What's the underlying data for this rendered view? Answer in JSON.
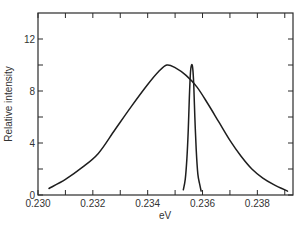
{
  "chart_data": {
    "type": "line",
    "title": "",
    "xlabel": "eV",
    "ylabel": "Relative intensity",
    "xlim": [
      0.23,
      0.2393
    ],
    "ylim": [
      0,
      14
    ],
    "grid": false,
    "legend": null,
    "x_ticks_major": [
      0.23,
      0.232,
      0.234,
      0.236,
      0.238
    ],
    "x_tick_labels": [
      "0.230",
      "0.232",
      "0.234",
      "0.236",
      "0.238"
    ],
    "x_ticks_minor": [
      0.231,
      0.233,
      0.235,
      0.237,
      0.239
    ],
    "y_ticks_major": [
      0,
      4,
      8,
      12
    ],
    "y_tick_labels": [
      "0",
      "4",
      "8",
      "12"
    ],
    "y_ticks_minor": [
      2,
      6,
      10
    ],
    "series": [
      {
        "name": "broad-band",
        "points": [
          [
            0.2304,
            0.5
          ],
          [
            0.231,
            1.2
          ],
          [
            0.2316,
            2.1
          ],
          [
            0.2322,
            3.2
          ],
          [
            0.2328,
            5.0
          ],
          [
            0.2334,
            6.8
          ],
          [
            0.234,
            8.5
          ],
          [
            0.2344,
            9.5
          ],
          [
            0.2347,
            10.0
          ],
          [
            0.235,
            9.8
          ],
          [
            0.2354,
            9.2
          ],
          [
            0.2358,
            8.3
          ],
          [
            0.2362,
            7.0
          ],
          [
            0.2366,
            5.6
          ],
          [
            0.237,
            4.2
          ],
          [
            0.2374,
            3.0
          ],
          [
            0.2378,
            2.0
          ],
          [
            0.2382,
            1.3
          ],
          [
            0.2386,
            0.8
          ],
          [
            0.2391,
            0.3
          ]
        ]
      },
      {
        "name": "narrow-line",
        "points": [
          [
            0.2353,
            0.4
          ],
          [
            0.23537,
            1.2
          ],
          [
            0.23543,
            2.8
          ],
          [
            0.23548,
            5.0
          ],
          [
            0.23552,
            7.5
          ],
          [
            0.23556,
            9.4
          ],
          [
            0.2356,
            10.0
          ],
          [
            0.23564,
            9.8
          ],
          [
            0.23568,
            8.5
          ],
          [
            0.23572,
            6.0
          ],
          [
            0.23577,
            3.5
          ],
          [
            0.23583,
            1.6
          ],
          [
            0.2359,
            0.8
          ],
          [
            0.23595,
            0.3
          ]
        ]
      }
    ]
  }
}
